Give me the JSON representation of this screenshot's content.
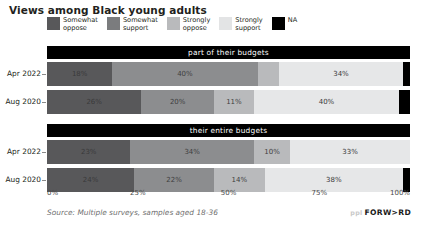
{
  "header": {
    "title": "Views among Black young adults"
  },
  "legend": {
    "position": "top",
    "items": [
      {
        "label": "Somewhat oppose",
        "color": "#58585a"
      },
      {
        "label": "Somewhat support",
        "color": "#7b7c7e"
      },
      {
        "label": "Strongly oppose",
        "color": "#b9babc"
      },
      {
        "label": "Strongly support",
        "color": "#e3e4e5"
      },
      {
        "label": "NA",
        "color": "#000000"
      }
    ]
  },
  "axis": {
    "ticks": [
      {
        "label": "0%",
        "value": 0
      },
      {
        "label": "25%",
        "value": 25
      },
      {
        "label": "50%",
        "value": 50
      },
      {
        "label": "75%",
        "value": 75
      },
      {
        "label": "100%",
        "value": 100
      }
    ],
    "min": 0,
    "max": 100
  },
  "footer": {
    "source": "Source: Multiple surveys, samples aged 18-36",
    "brand_pre": "ppl",
    "brand_main": "FORW>RD"
  },
  "chart_data": {
    "type": "bar",
    "orientation": "horizontal",
    "stacked": true,
    "normalized": true,
    "title": "Views among Black young adults",
    "xlabel": "",
    "ylabel": "",
    "xlim": [
      0,
      100
    ],
    "grid": false,
    "legend_position": "top",
    "series": [
      {
        "name": "Somewhat oppose",
        "color": "#58585a"
      },
      {
        "name": "Somewhat support",
        "color": "#7b7c7e"
      },
      {
        "name": "Strongly oppose",
        "color": "#b9babc"
      },
      {
        "name": "Strongly support",
        "color": "#e3e4e5"
      },
      {
        "name": "NA",
        "color": "#000000"
      }
    ],
    "panels": [
      {
        "title": "part of their budgets",
        "rows": [
          {
            "category": "Apr 2022",
            "segments": [
              {
                "series": "Somewhat oppose",
                "value": 18,
                "label": "18%",
                "color": "#58585a",
                "text_color": "#3a3a3a"
              },
              {
                "series": "Somewhat support",
                "value": 40,
                "label": "40%",
                "color": "#8c8d8f",
                "text_color": "#3f3f3f"
              },
              {
                "series": "Strongly oppose",
                "value": 6,
                "label": "",
                "color": "#b9babc",
                "text_color": "#3f3f3f"
              },
              {
                "series": "Strongly support",
                "value": 34,
                "label": "34%",
                "color": "#e6e7e8",
                "text_color": "#3a3a3a"
              },
              {
                "series": "NA",
                "value": 2,
                "label": "",
                "color": "#000000",
                "text_color": "#ffffff"
              }
            ]
          },
          {
            "category": "Aug 2020",
            "segments": [
              {
                "series": "Somewhat oppose",
                "value": 26,
                "label": "26%",
                "color": "#58585a",
                "text_color": "#3a3a3a"
              },
              {
                "series": "Somewhat support",
                "value": 20,
                "label": "20%",
                "color": "#8c8d8f",
                "text_color": "#3f3f3f"
              },
              {
                "series": "Strongly oppose",
                "value": 11,
                "label": "11%",
                "color": "#b9babc",
                "text_color": "#3f3f3f"
              },
              {
                "series": "Strongly support",
                "value": 40,
                "label": "40%",
                "color": "#e6e7e8",
                "text_color": "#3a3a3a"
              },
              {
                "series": "NA",
                "value": 3,
                "label": "",
                "color": "#000000",
                "text_color": "#ffffff"
              }
            ]
          }
        ]
      },
      {
        "title": "their entire budgets",
        "rows": [
          {
            "category": "Apr 2022",
            "segments": [
              {
                "series": "Somewhat oppose",
                "value": 23,
                "label": "23%",
                "color": "#58585a",
                "text_color": "#3a3a3a"
              },
              {
                "series": "Somewhat support",
                "value": 34,
                "label": "34%",
                "color": "#8c8d8f",
                "text_color": "#3f3f3f"
              },
              {
                "series": "Strongly oppose",
                "value": 10,
                "label": "10%",
                "color": "#b9babc",
                "text_color": "#3f3f3f"
              },
              {
                "series": "Strongly support",
                "value": 33,
                "label": "33%",
                "color": "#e6e7e8",
                "text_color": "#3a3a3a"
              },
              {
                "series": "NA",
                "value": 0,
                "label": "",
                "color": "#000000",
                "text_color": "#ffffff"
              }
            ]
          },
          {
            "category": "Aug 2020",
            "segments": [
              {
                "series": "Somewhat oppose",
                "value": 24,
                "label": "24%",
                "color": "#58585a",
                "text_color": "#3a3a3a"
              },
              {
                "series": "Somewhat support",
                "value": 22,
                "label": "22%",
                "color": "#8c8d8f",
                "text_color": "#3f3f3f"
              },
              {
                "series": "Strongly oppose",
                "value": 14,
                "label": "14%",
                "color": "#b9babc",
                "text_color": "#3f3f3f"
              },
              {
                "series": "Strongly support",
                "value": 38,
                "label": "38%",
                "color": "#e6e7e8",
                "text_color": "#3a3a3a"
              },
              {
                "series": "NA",
                "value": 2,
                "label": "",
                "color": "#000000",
                "text_color": "#ffffff"
              }
            ]
          }
        ]
      }
    ]
  }
}
